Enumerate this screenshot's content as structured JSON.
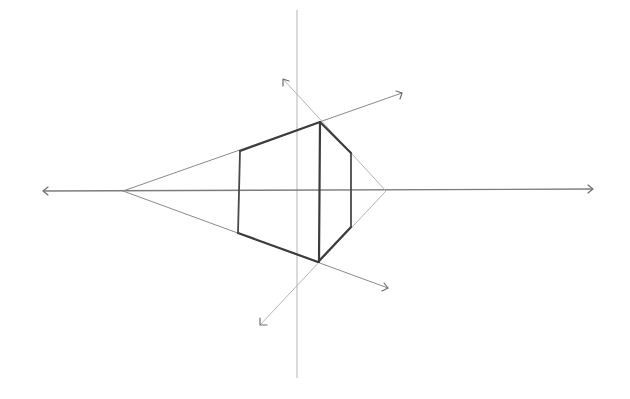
{
  "drawing": {
    "description": "Pencil sketch of a two-point-style perspective construction: a truncated wedge/prism drawn between converging guide rays",
    "colors": {
      "background": "#ffffff",
      "guide_line": "#8a8a8a",
      "bold_edge": "#3c3c3c"
    },
    "horizon_line": {
      "x1": 43,
      "y1": 191,
      "x2": 593,
      "y2": 189,
      "arrows": [
        "left",
        "right"
      ]
    },
    "vertical_axis": {
      "x1": 297,
      "y1": 10,
      "x2": 297,
      "y2": 378
    },
    "vanishing_point_left": {
      "x": 123,
      "y": 191
    },
    "apex_right": {
      "x": 386,
      "y": 191
    },
    "rays": [
      {
        "name": "upper-ray",
        "from": [
          123,
          191
        ],
        "to": [
          402,
          93
        ]
      },
      {
        "name": "lower-ray",
        "from": [
          123,
          191
        ],
        "to": [
          388,
          288
        ]
      },
      {
        "name": "upper-diagonal",
        "from": [
          386,
          191
        ],
        "to": [
          283,
          79
        ]
      },
      {
        "name": "lower-diagonal",
        "from": [
          386,
          191
        ],
        "to": [
          260,
          325
        ]
      }
    ],
    "shape": {
      "outline": [
        [
          240,
          151
        ],
        [
          320,
          122
        ],
        [
          351,
          153
        ],
        [
          351,
          227
        ],
        [
          318,
          262
        ],
        [
          238,
          233
        ]
      ],
      "verticals": [
        {
          "x": 240,
          "y_top": 151,
          "y_bottom": 233
        },
        {
          "x": 320,
          "y_top": 122,
          "y_bottom": 262
        },
        {
          "x": 351,
          "y_top": 153,
          "y_bottom": 227
        }
      ]
    }
  }
}
